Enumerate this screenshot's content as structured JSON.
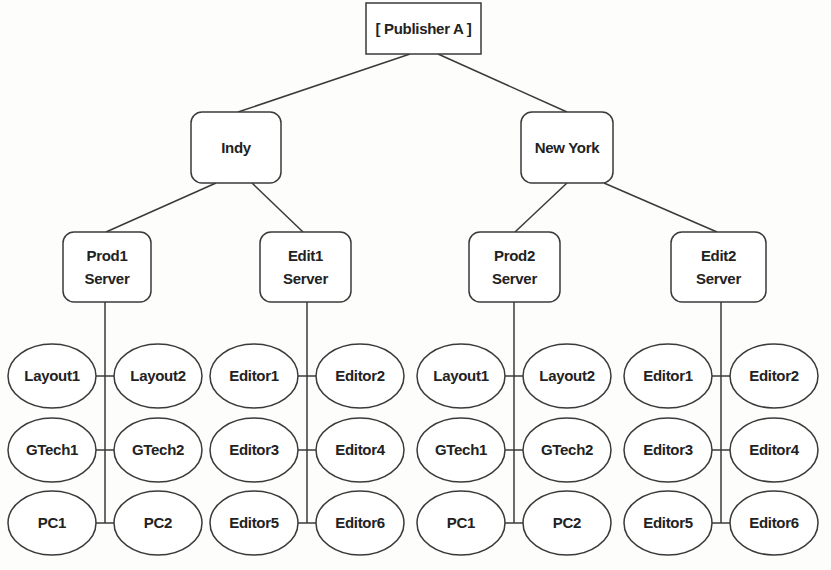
{
  "diagram": {
    "type": "tree",
    "root": {
      "id": "publisher",
      "label": "[ Publisher A ]",
      "box": [
        366,
        3,
        115,
        51
      ]
    },
    "sites": [
      {
        "id": "indy",
        "label": "Indy",
        "box": [
          191,
          112,
          90,
          71
        ],
        "servers": [
          {
            "id": "prod1",
            "label": [
              "Prod1",
              "Server"
            ],
            "box": [
              63,
              232,
              88,
              70
            ],
            "trunk_x": 105,
            "clients": [
              [
                "Layout1",
                "Layout2"
              ],
              [
                "GTech1",
                "GTech2"
              ],
              [
                "PC1",
                "PC2"
              ]
            ]
          },
          {
            "id": "edit1",
            "label": [
              "Edit1",
              "Server"
            ],
            "box": [
              260,
              232,
              91,
              70
            ],
            "trunk_x": 307,
            "clients": [
              [
                "Editor1",
                "Editor2"
              ],
              [
                "Editor3",
                "Editor4"
              ],
              [
                "Editor5",
                "Editor6"
              ]
            ]
          }
        ]
      },
      {
        "id": "newyork",
        "label": "New York",
        "box": [
          521,
          112,
          92,
          71
        ],
        "servers": [
          {
            "id": "prod2",
            "label": [
              "Prod2",
              "Server"
            ],
            "box": [
              469,
              232,
              91,
              70
            ],
            "trunk_x": 514,
            "clients": [
              [
                "Layout1",
                "Layout2"
              ],
              [
                "GTech1",
                "GTech2"
              ],
              [
                "PC1",
                "PC2"
              ]
            ]
          },
          {
            "id": "edit2",
            "label": [
              "Edit2",
              "Server"
            ],
            "box": [
              671,
              232,
              95,
              70
            ],
            "trunk_x": 721,
            "clients": [
              [
                "Editor1",
                "Editor2"
              ],
              [
                "Editor3",
                "Editor4"
              ],
              [
                "Editor5",
                "Editor6"
              ]
            ]
          }
        ]
      }
    ],
    "edges": [
      [
        410,
        54,
        238,
        112
      ],
      [
        438,
        54,
        567,
        112
      ],
      [
        216,
        183,
        106,
        232
      ],
      [
        252,
        183,
        303,
        232
      ],
      [
        567,
        183,
        515,
        232
      ],
      [
        604,
        183,
        717,
        232
      ]
    ],
    "client_rows_y": [
      376,
      450,
      523
    ],
    "client_ellipse": {
      "rx": 44,
      "ry": 32,
      "offset_x": 53
    }
  }
}
